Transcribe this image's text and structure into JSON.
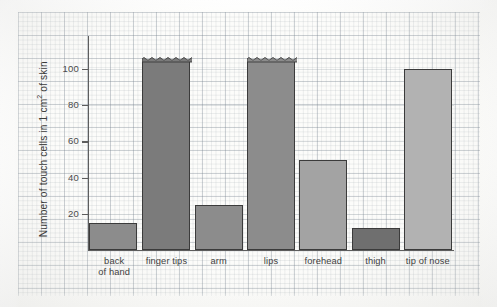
{
  "chart_data": {
    "type": "bar",
    "title": "",
    "subtitle": "",
    "xlabel": "",
    "ylabel": "Number of touch cells in 1 cm² of skin",
    "ylabel_parts": {
      "prefix": "Number of touch cells in 1 cm",
      "exponent": "2",
      "suffix": " of skin"
    },
    "categories": [
      "back of hand",
      "finger tips",
      "arm",
      "lips",
      "forehead",
      "thigh",
      "tip of nose"
    ],
    "category_lines": [
      [
        "back",
        "of hand"
      ],
      [
        "finger tips"
      ],
      [
        "arm"
      ],
      [
        "lips"
      ],
      [
        "forehead"
      ],
      [
        "thigh"
      ],
      [
        "tip of nose"
      ]
    ],
    "values": [
      15,
      105,
      25,
      105,
      50,
      12,
      100
    ],
    "broken_axis_bars": [
      "finger tips",
      "lips"
    ],
    "bar_colors": [
      "#8c8c8c",
      "#7b7b7b",
      "#8c8c8c",
      "#8c8c8c",
      "#a3a3a3",
      "#6f6f6f",
      "#b2b2b2"
    ],
    "ylim": [
      0,
      118
    ],
    "yticks": [
      20,
      40,
      60,
      80,
      100
    ],
    "ytick_labels": [
      "20",
      "40",
      "60",
      "80",
      "100"
    ],
    "grid": true,
    "legend": "none"
  },
  "bars": [
    {
      "label": "back of hand",
      "value": 15,
      "color": "#8c8c8c",
      "broken": false
    },
    {
      "label": "finger tips",
      "value": 105,
      "color": "#7b7b7b",
      "broken": true
    },
    {
      "label": "arm",
      "value": 25,
      "color": "#8c8c8c",
      "broken": false
    },
    {
      "label": "lips",
      "value": 105,
      "color": "#8c8c8c",
      "broken": true
    },
    {
      "label": "forehead",
      "value": 50,
      "color": "#a3a3a3",
      "broken": false
    },
    {
      "label": "thigh",
      "value": 12,
      "color": "#6f6f6f",
      "broken": false
    },
    {
      "label": "tip of nose",
      "value": 100,
      "color": "#b2b2b2",
      "broken": false
    }
  ],
  "axis": {
    "y_title_prefix": "Number of touch cells in 1 cm",
    "y_title_exponent": "2",
    "y_title_suffix": " of skin",
    "ticks": [
      "100",
      "80",
      "60",
      "40",
      "20"
    ]
  }
}
